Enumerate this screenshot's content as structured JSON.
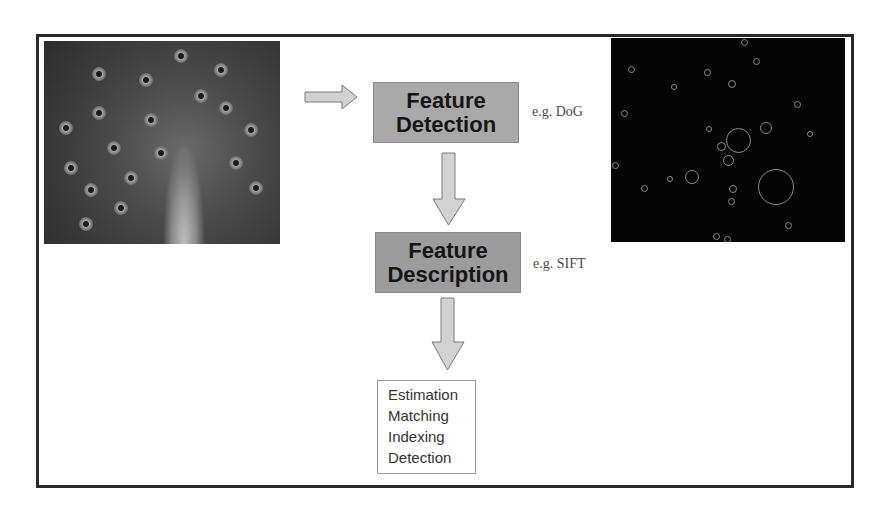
{
  "diagram": {
    "input_image": {
      "subject": "peacock-photo",
      "label": ""
    },
    "output_image": {
      "subject": "detected-keypoints-circles",
      "label": ""
    },
    "steps": [
      {
        "title_line1": "Feature",
        "title_line2": "Detection",
        "example": "e.g. DoG"
      },
      {
        "title_line1": "Feature",
        "title_line2": "Description",
        "example": "e.g. SIFT"
      }
    ],
    "applications": [
      "Estimation",
      "Matching",
      "Indexing",
      "Detection"
    ],
    "colors": {
      "frame": "#2a2a2a",
      "box_fill": "#a9a9a9",
      "arrow_fill": "#d2d2d2",
      "keypoint_bg": "#050505"
    }
  }
}
